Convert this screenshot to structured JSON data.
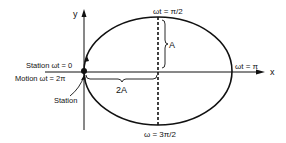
{
  "diagram": {
    "axes": {
      "x_label": "x",
      "y_label": "y"
    },
    "labels": {
      "top": "ωt = π/2",
      "right": "ωt = π",
      "bottom": "ω = 3π/2",
      "station_wt0": "Station  ωt = 0",
      "motion_wt2pi": "Motion  ωt = 2π",
      "station": "Station",
      "amplitude_a": "A",
      "amplitude_2a": "2A"
    },
    "colors": {
      "stroke": "#111111",
      "background": "#ffffff"
    }
  }
}
